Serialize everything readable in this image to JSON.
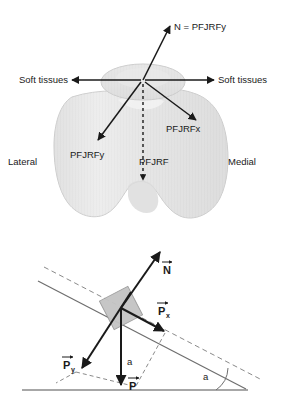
{
  "figure": {
    "panels": [
      {
        "id": "top-panel",
        "name": "patellofemoral-joint-forces",
        "labels": {
          "normal_force": "N = PFJRFy",
          "soft_tissues_left": "Soft tissues",
          "soft_tissues_right": "Soft tissues",
          "pfjrfx": "PFJRFx",
          "pfjrfy": "PFJRFy",
          "pfjrf": "PFJRF",
          "lateral": "Lateral",
          "medial": "Medial"
        }
      },
      {
        "id": "bottom-panel",
        "name": "inclined-plane-free-body",
        "labels": {
          "normal_vector": "N",
          "px_vector": "P",
          "px_subscript": "x",
          "py_vector": "P",
          "py_subscript": "y",
          "p_vector": "P",
          "height_label": "a",
          "angle_label": "a"
        }
      }
    ]
  },
  "colors": {
    "stroke": "#1a1a1a",
    "bone_fill": "#e8e8e8",
    "bone_fill_light": "#f0f0f0",
    "bone_edge": "#c9c9c9",
    "block_fill": "#c4c4c4",
    "plane_line": "#6e6e6e",
    "dashed_line": "#8a8a8a",
    "ground_line": "#8a8a8a",
    "text": "#1a1a1a"
  }
}
